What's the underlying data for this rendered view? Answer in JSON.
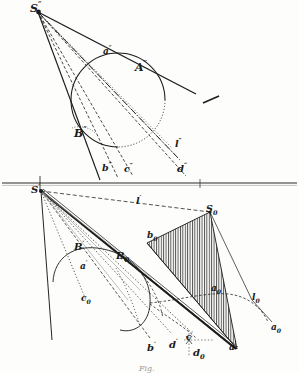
{
  "figure": {
    "title": "Fig.",
    "caption": "",
    "domain_kind": "descriptive-geometry-plate",
    "ink_color": "#1b1b1b",
    "paper_color": "#fdfdfb",
    "hatch_color": "#2b2b2b"
  },
  "ground_line": {
    "label": "",
    "y": 183
  },
  "upper_view": {
    "name": "vertical-projection",
    "vertex": {
      "label": "S",
      "prime": "″",
      "x": 38,
      "y": 10
    },
    "labels": [
      {
        "id": "S2",
        "base": "S",
        "mark": "″",
        "sup": true,
        "x": 32,
        "y": 4
      },
      {
        "id": "a2",
        "base": "a",
        "mark": "″",
        "sup": true,
        "x": 104,
        "y": 50
      },
      {
        "id": "A2",
        "base": "A",
        "mark": "″",
        "sup": true,
        "x": 136,
        "y": 66
      },
      {
        "id": "B2",
        "base": "B",
        "mark": "″",
        "sup": true,
        "x": 76,
        "y": 131
      },
      {
        "id": "b2",
        "base": "b",
        "mark": "″",
        "sup": true,
        "x": 103,
        "y": 167
      },
      {
        "id": "c2",
        "base": "c",
        "mark": "″",
        "sup": true,
        "x": 125,
        "y": 168
      },
      {
        "id": "l2",
        "base": "l",
        "mark": "″",
        "sup": true,
        "x": 176,
        "y": 143
      },
      {
        "id": "d2",
        "base": "d",
        "mark": "″",
        "sup": true,
        "x": 178,
        "y": 167
      }
    ],
    "circle": {
      "cx": 118,
      "cy": 100,
      "r": 47
    },
    "stray_dash": {
      "x1": 203,
      "y1": 103,
      "x2": 218,
      "y2": 97
    }
  },
  "lower_view": {
    "name": "horizontal-projection",
    "vertex": {
      "label": "S",
      "prime": "′",
      "x": 40,
      "y": 190
    },
    "labels": [
      {
        "id": "S1",
        "base": "S",
        "mark": "′",
        "sup": true,
        "x": 34,
        "y": 186
      },
      {
        "id": "l1",
        "base": "l",
        "mark": "′",
        "sup": true,
        "x": 137,
        "y": 198
      },
      {
        "id": "S0",
        "base": "S",
        "mark": "0",
        "sup": false,
        "x": 207,
        "y": 208
      },
      {
        "id": "b0",
        "base": "b",
        "mark": "0",
        "sup": false,
        "x": 148,
        "y": 235
      },
      {
        "id": "B1",
        "base": "B",
        "mark": "′",
        "sup": true,
        "x": 76,
        "y": 245
      },
      {
        "id": "B0",
        "base": "B",
        "mark": "0",
        "sup": false,
        "x": 118,
        "y": 256
      },
      {
        "id": "a1",
        "base": "a",
        "mark": "′",
        "sup": true,
        "x": 81,
        "y": 264
      },
      {
        "id": "a0",
        "base": "a",
        "mark": "0",
        "sup": false,
        "x": 212,
        "y": 288
      },
      {
        "id": "l0",
        "base": "l",
        "mark": "0",
        "sup": false,
        "x": 253,
        "y": 297
      },
      {
        "id": "c0",
        "base": "c",
        "mark": "0",
        "sup": false,
        "x": 82,
        "y": 298
      },
      {
        "id": "aR",
        "base": "a",
        "mark": "0",
        "sup": false,
        "x": 272,
        "y": 327
      },
      {
        "id": "b1",
        "base": "b",
        "mark": "′",
        "sup": true,
        "x": 148,
        "y": 345
      },
      {
        "id": "d1",
        "base": "d",
        "mark": "′",
        "sup": true,
        "x": 170,
        "y": 342
      },
      {
        "id": "c1",
        "base": "c",
        "mark": "′",
        "sup": true,
        "x": 187,
        "y": 336
      },
      {
        "id": "d0",
        "base": "d",
        "mark": "0",
        "sup": false,
        "x": 194,
        "y": 352
      },
      {
        "id": "aB",
        "base": "a",
        "mark": "′",
        "sup": true,
        "x": 230,
        "y": 345
      }
    ],
    "hatched_triangle": {
      "points": "210,212 147,243 237,349",
      "hatch_spacing": 2.4,
      "hatch_direction": "vertical"
    }
  }
}
